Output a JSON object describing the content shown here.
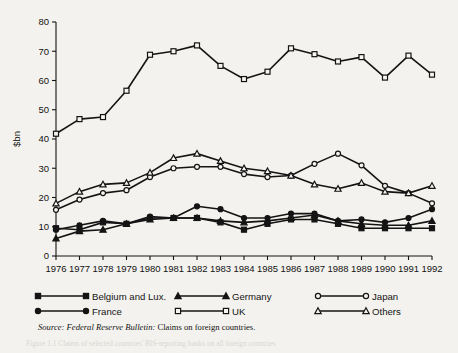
{
  "chart_data": {
    "type": "line",
    "title": "",
    "xlabel": "",
    "ylabel": "$bn",
    "categories": [
      1976,
      1977,
      1978,
      1979,
      1980,
      1981,
      1982,
      1983,
      1984,
      1985,
      1986,
      1987,
      1988,
      1989,
      1990,
      1991,
      1992
    ],
    "xtick_labels": [
      "1976",
      "1977",
      "1978",
      "1979",
      "1980",
      "1981",
      "1982",
      "1983",
      "1984",
      "1985",
      "1986",
      "1987",
      "1988",
      "1989",
      "1990",
      "1991",
      "1992"
    ],
    "ytick_labels": [
      "0",
      "10",
      "20",
      "30",
      "40",
      "50",
      "60",
      "70",
      "80"
    ],
    "ylim": [
      0,
      80
    ],
    "ytick_step": 10,
    "grid": false,
    "legend_position": "below-axes",
    "series": [
      {
        "name": "Belgium and Lux.",
        "marker": "filled-square",
        "values": [
          9.5,
          9.0,
          11.5,
          11.0,
          13.0,
          13.0,
          13.0,
          11.5,
          9.0,
          11.0,
          12.5,
          12.5,
          11.0,
          9.5,
          9.5,
          9.5,
          9.5
        ]
      },
      {
        "name": "France",
        "marker": "filled-circle",
        "values": [
          9.0,
          10.5,
          12.0,
          11.0,
          13.5,
          13.0,
          17.0,
          16.0,
          13.0,
          13.0,
          14.5,
          14.5,
          12.0,
          12.5,
          11.5,
          13.0,
          16.0
        ]
      },
      {
        "name": "Germany",
        "marker": "filled-triangle",
        "values": [
          6.0,
          8.5,
          9.0,
          11.0,
          12.5,
          13.0,
          13.0,
          12.0,
          11.5,
          12.0,
          13.0,
          14.0,
          12.0,
          11.0,
          10.5,
          10.5,
          12.0
        ]
      },
      {
        "name": "UK",
        "marker": "open-square",
        "values": [
          41.8,
          46.8,
          47.5,
          56.5,
          68.8,
          70.0,
          72.0,
          65.0,
          60.5,
          63.0,
          71.0,
          69.0,
          66.5,
          68.0,
          61.0,
          68.5,
          62.0
        ]
      },
      {
        "name": "Japan",
        "marker": "open-circle",
        "values": [
          15.8,
          19.3,
          21.5,
          22.5,
          27.0,
          30.0,
          30.5,
          30.5,
          28.0,
          27.0,
          27.5,
          31.5,
          35.0,
          31.0,
          24.0,
          21.5,
          18.0
        ]
      },
      {
        "name": "Others",
        "marker": "open-triangle",
        "values": [
          18.0,
          22.0,
          24.5,
          25.0,
          28.5,
          33.5,
          35.0,
          32.5,
          30.0,
          29.0,
          27.5,
          24.5,
          23.0,
          25.0,
          22.0,
          21.5,
          24.0
        ]
      }
    ],
    "source_note": {
      "prefix": "Source:",
      "italic": "Federal Reserve Bulletin:",
      "rest": "Claims on foreign countries."
    }
  },
  "legend": {
    "items": [
      {
        "label": "Belgium and Lux.",
        "marker": "filled-square"
      },
      {
        "label": "France",
        "marker": "filled-circle"
      },
      {
        "label": "Germany",
        "marker": "filled-triangle"
      },
      {
        "label": "UK",
        "marker": "open-square"
      },
      {
        "label": "Japan",
        "marker": "open-circle"
      },
      {
        "label": "Others",
        "marker": "open-triangle"
      }
    ]
  },
  "caption": {
    "text": "Figure 1.1  Claims of selected countries' BIS-reporting banks on all foreign countries"
  }
}
